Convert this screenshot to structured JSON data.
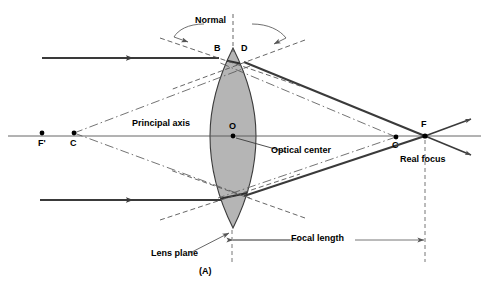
{
  "figure": {
    "caption": "(A)",
    "background_color": "#ffffff",
    "lens_fill_color": "#b3b3b3",
    "lens_stroke_color": "#333333",
    "ray_color": "#3a3a3a",
    "construction_color": "#555555"
  },
  "labels": {
    "normal": "Normal",
    "principal_axis": "Principal axis",
    "optical_center": "Optical center",
    "real_focus": "Real focus",
    "lens_plane": "Lens plane",
    "focal_length": "Focal length"
  },
  "points": {
    "f_prime": "F'",
    "c_left": "C",
    "b": "B",
    "d": "D",
    "o": "O",
    "c_right": "C",
    "f": "F"
  },
  "point_positions": {
    "f_prime": {
      "x": 42,
      "y": 133
    },
    "c_left": {
      "x": 74,
      "y": 133
    },
    "b": {
      "x": 218,
      "y": 57
    },
    "d": {
      "x": 244,
      "y": 57
    },
    "o": {
      "x": 233,
      "y": 136
    },
    "c_right": {
      "x": 396,
      "y": 137
    },
    "f": {
      "x": 425,
      "y": 136
    }
  },
  "geometry": {
    "lens_top_y": 48,
    "lens_bottom_y": 228,
    "lens_center_x": 233,
    "lens_half_width": 23,
    "axis_y": 136,
    "top_ray_y": 58,
    "bottom_ray_y": 200,
    "focal_length_dim_y": 240,
    "focal_length_start_x": 232,
    "focal_length_end_x": 425
  }
}
